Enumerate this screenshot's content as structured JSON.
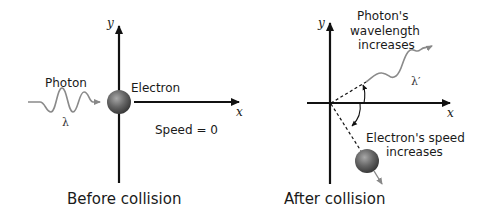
{
  "before": {
    "caption": "Before collision",
    "axis_x": "x",
    "axis_y": "y",
    "photon_label": "Photon",
    "wavelength_label": "λ",
    "electron_label": "Electron",
    "speed_label": "Speed = 0"
  },
  "after": {
    "caption": "After collision",
    "axis_x": "x",
    "axis_y": "y",
    "photon_line1": "Photon's",
    "photon_line2": "wavelength",
    "photon_line3": "increases",
    "wavelength_label": "λ′",
    "electron_line1": "Electron's speed",
    "electron_line2": "increases"
  },
  "colors": {
    "axis": "#111111",
    "wave": "#8a8a8a",
    "electron": "#5a5a5a",
    "electron_highlight": "#9a9a9a"
  }
}
